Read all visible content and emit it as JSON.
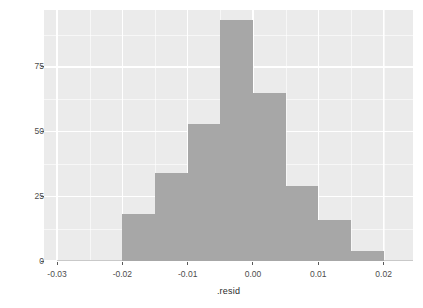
{
  "chart_data": {
    "type": "bar",
    "chart_subtype": "histogram",
    "title": "",
    "xlabel": ".resid",
    "ylabel": "count",
    "xlim": [
      -0.032,
      0.0245
    ],
    "ylim": [
      0,
      97
    ],
    "binwidth": 0.005,
    "grid": true,
    "legend": false,
    "categories": [
      "-0.0275",
      "-0.0225",
      "-0.0175",
      "-0.0125",
      "-0.0075",
      "-0.0025",
      "0.0025",
      "0.0075",
      "0.0125",
      "0.0175",
      "0.0225"
    ],
    "bin_edges": [
      -0.03,
      -0.025,
      -0.02,
      -0.015,
      -0.01,
      -0.005,
      0.0,
      0.005,
      0.01,
      0.015,
      0.02,
      0.025
    ],
    "values": [
      0,
      0,
      18,
      34,
      53,
      93,
      65,
      29,
      16,
      4,
      0
    ],
    "bars": [
      {
        "bin_start": -0.03,
        "bin_end": -0.025,
        "count": 0
      },
      {
        "bin_start": -0.025,
        "bin_end": -0.02,
        "count": 0
      },
      {
        "bin_start": -0.02,
        "bin_end": -0.015,
        "count": 18
      },
      {
        "bin_start": -0.015,
        "bin_end": -0.01,
        "count": 34
      },
      {
        "bin_start": -0.01,
        "bin_end": -0.005,
        "count": 53
      },
      {
        "bin_start": -0.005,
        "bin_end": 0.0,
        "count": 93
      },
      {
        "bin_start": 0.0,
        "bin_end": 0.005,
        "count": 65
      },
      {
        "bin_start": 0.005,
        "bin_end": 0.01,
        "count": 29
      },
      {
        "bin_start": 0.01,
        "bin_end": 0.015,
        "count": 16
      },
      {
        "bin_start": 0.015,
        "bin_end": 0.02,
        "count": 4
      },
      {
        "bin_start": 0.02,
        "bin_end": 0.025,
        "count": 0
      }
    ],
    "x_ticks": [
      -0.03,
      -0.02,
      -0.01,
      0.0,
      0.01,
      0.02
    ],
    "x_tick_labels": [
      "-0.03",
      "-0.02",
      "-0.01",
      "0.00",
      "0.01",
      "0.02"
    ],
    "x_minor_ticks": [
      -0.025,
      -0.015,
      -0.005,
      0.005,
      0.015,
      0.02
    ],
    "y_ticks": [
      0,
      25,
      50,
      75
    ],
    "y_tick_labels": [
      "0",
      "25",
      "50",
      "75"
    ],
    "y_minor_ticks": [
      12.5,
      37.5,
      62.5,
      87.5
    ]
  },
  "style": {
    "panel_background": "#ebebeb",
    "grid_color": "#ffffff",
    "bar_fill": "#a7a7a7",
    "axis_text_color": "#4d4d4d",
    "axis_title_color": "#2b2b2b",
    "page_background": "#ffffff"
  }
}
